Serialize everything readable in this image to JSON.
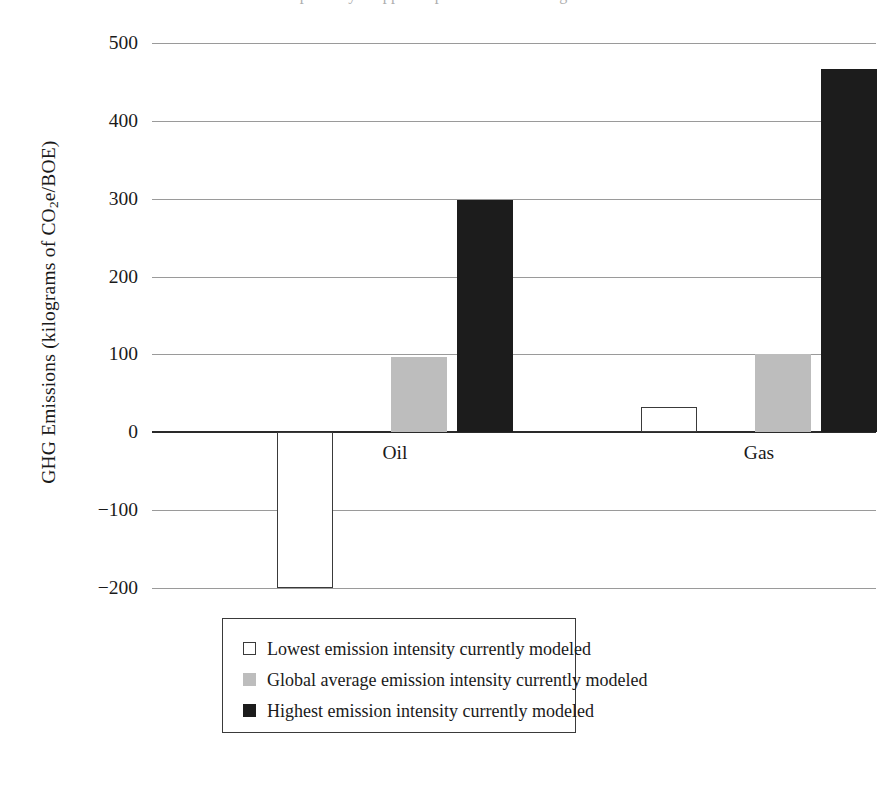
{
  "figure": {
    "top_caption_fragment": "partially cropped caption text above figure"
  },
  "axes": {
    "y_title_prefix": "GHG Emissions (kilograms of CO",
    "y_title_sub": "2",
    "y_title_suffix": "e/BOE)",
    "y_title_full": "GHG Emissions (kilograms of CO2e/BOE)",
    "y_ticks": [
      "500",
      "400",
      "300",
      "200",
      "100",
      "0",
      "-100",
      "-200"
    ],
    "category_labels": [
      "Oil",
      "Gas"
    ]
  },
  "legend": {
    "entries": [
      {
        "swatch": "white-open-square",
        "label": "Lowest emission intensity currently modeled"
      },
      {
        "swatch": "gray-filled-square",
        "label": "Global average emission intensity currently modeled"
      },
      {
        "swatch": "black-filled-square",
        "label": "Highest emission intensity currently modeled"
      }
    ]
  },
  "colors": {
    "lowest": "#ffffff",
    "average": "#bdbdbd",
    "highest": "#1c1c1c",
    "axis": "#2a2a2a",
    "grid": "#9a9a9a"
  },
  "chart_data": {
    "type": "bar",
    "title": "",
    "xlabel": "",
    "ylabel": "GHG Emissions (kilograms of CO2e/BOE)",
    "categories": [
      "Oil",
      "Gas"
    ],
    "series": [
      {
        "name": "Lowest emission intensity currently modeled",
        "color": "#ffffff",
        "values": [
          -200,
          32
        ]
      },
      {
        "name": "Global average emission intensity currently modeled",
        "color": "#bdbdbd",
        "values": [
          97,
          100
        ]
      },
      {
        "name": "Highest emission intensity currently modeled",
        "color": "#1c1c1c",
        "values": [
          298,
          466
        ]
      }
    ],
    "ylim": [
      -200,
      500
    ],
    "yticks": [
      -200,
      -100,
      0,
      100,
      200,
      300,
      400,
      500
    ],
    "grid": true,
    "legend_position": "bottom-center"
  }
}
